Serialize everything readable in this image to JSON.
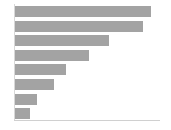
{
  "chart_data": {
    "type": "bar",
    "orientation": "horizontal",
    "title": "",
    "subtitle": "",
    "xlabel": "",
    "ylabel": "",
    "grid": false,
    "legend": null,
    "legend_position": "none",
    "categories": [
      "1",
      "2",
      "3",
      "4",
      "5",
      "6",
      "7",
      "8"
    ],
    "tick_labels_x": [],
    "tick_labels_y": [],
    "xlim": [
      0,
      150
    ],
    "values": [
      141,
      132,
      97,
      77,
      53,
      40,
      23,
      15
    ],
    "series": [
      {
        "name": "",
        "values": [
          141,
          132,
          97,
          77,
          53,
          40,
          23,
          15
        ]
      }
    ],
    "annotations": [],
    "bar_color": "#a3a3a3",
    "background_color": "#ffffff",
    "axis_color": "#d4d4d4"
  },
  "layout": {
    "bar_height_px": 11,
    "bar_pitch_px": 14.6,
    "plot_left_px": 15,
    "plot_top_px": 6,
    "baseline_top_px": 120
  }
}
